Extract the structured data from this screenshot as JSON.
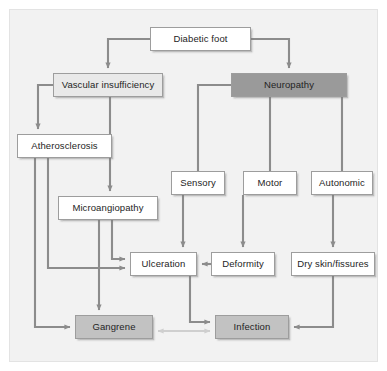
{
  "figure": {
    "width": 387,
    "height": 371,
    "background": "#f2f2f2",
    "page_background": "#ffffff",
    "border_color": "#e3e3e3"
  },
  "palette": {
    "white_box": "#ffffff",
    "light_box": "#e9e9e9",
    "mid_box": "#c2c2c2",
    "dark_box": "#9a9a9a",
    "box_border": "#9d9d9d",
    "connector": "#8c8c8c",
    "connector_light": "#cfcfcf",
    "text": "#242424"
  },
  "nodes": [
    {
      "id": "diabetic-foot",
      "label": "Diabetic foot",
      "shade": "white",
      "x": 150,
      "y": 27,
      "w": 101,
      "h": 24
    },
    {
      "id": "vascular",
      "label": "Vascular insufficiency",
      "shade": "light",
      "x": 53,
      "y": 73,
      "w": 110,
      "h": 24
    },
    {
      "id": "neuropathy",
      "label": "Neuropathy",
      "shade": "dark",
      "x": 231,
      "y": 73,
      "w": 116,
      "h": 24
    },
    {
      "id": "atherosclerosis",
      "label": "Atherosclerosis",
      "shade": "white",
      "x": 17,
      "y": 134,
      "w": 95,
      "h": 24
    },
    {
      "id": "microangiopathy",
      "label": "Microangiopathy",
      "shade": "white",
      "x": 58,
      "y": 196,
      "w": 100,
      "h": 24
    },
    {
      "id": "sensory",
      "label": "Sensory",
      "shade": "white",
      "x": 171,
      "y": 171,
      "w": 54,
      "h": 24
    },
    {
      "id": "motor",
      "label": "Motor",
      "shade": "white",
      "x": 243,
      "y": 171,
      "w": 54,
      "h": 24
    },
    {
      "id": "autonomic",
      "label": "Autonomic",
      "shade": "white",
      "x": 311,
      "y": 171,
      "w": 62,
      "h": 24
    },
    {
      "id": "ulceration",
      "label": "Ulceration",
      "shade": "white",
      "x": 130,
      "y": 252,
      "w": 67,
      "h": 24
    },
    {
      "id": "deformity",
      "label": "Deformity",
      "shade": "white",
      "x": 211,
      "y": 252,
      "w": 64,
      "h": 24
    },
    {
      "id": "dry-skin",
      "label": "Dry skin/fissures",
      "shade": "white",
      "x": 291,
      "y": 252,
      "w": 84,
      "h": 24
    },
    {
      "id": "gangrene",
      "label": "Gangrene",
      "shade": "mid",
      "x": 75,
      "y": 315,
      "w": 78,
      "h": 24
    },
    {
      "id": "infection",
      "label": "Infection",
      "shade": "mid",
      "x": 215,
      "y": 315,
      "w": 74,
      "h": 24
    }
  ],
  "edges": [
    {
      "id": "e-df-vascular",
      "from": "diabetic-foot",
      "to": "vascular",
      "style": "solid",
      "arrow": "single"
    },
    {
      "id": "e-df-neuropathy",
      "from": "diabetic-foot",
      "to": "neuropathy",
      "style": "solid",
      "arrow": "single"
    },
    {
      "id": "e-vasc-athero",
      "from": "vascular",
      "to": "atherosclerosis",
      "style": "solid",
      "arrow": "single"
    },
    {
      "id": "e-vasc-micro",
      "from": "vascular",
      "to": "microangiopathy",
      "style": "solid",
      "arrow": "single"
    },
    {
      "id": "e-athero-ulcer",
      "from": "atherosclerosis",
      "to": "ulceration",
      "style": "solid",
      "arrow": "single"
    },
    {
      "id": "e-athero-gangrene",
      "from": "atherosclerosis",
      "to": "gangrene",
      "style": "solid",
      "arrow": "single"
    },
    {
      "id": "e-micro-ulcer",
      "from": "microangiopathy",
      "to": "ulceration",
      "style": "solid",
      "arrow": "single"
    },
    {
      "id": "e-micro-gangrene",
      "from": "microangiopathy",
      "to": "gangrene",
      "style": "solid",
      "arrow": "single"
    },
    {
      "id": "e-neuro-sensory",
      "from": "neuropathy",
      "to": "sensory",
      "style": "solid",
      "arrow": "none"
    },
    {
      "id": "e-neuro-motor",
      "from": "neuropathy",
      "to": "motor",
      "style": "solid",
      "arrow": "none"
    },
    {
      "id": "e-neuro-autonomic",
      "from": "neuropathy",
      "to": "autonomic",
      "style": "solid",
      "arrow": "none"
    },
    {
      "id": "e-sensory-ulcer",
      "from": "sensory",
      "to": "ulceration",
      "style": "solid",
      "arrow": "single"
    },
    {
      "id": "e-motor-deformity",
      "from": "motor",
      "to": "deformity",
      "style": "solid",
      "arrow": "single"
    },
    {
      "id": "e-auto-dryskin",
      "from": "autonomic",
      "to": "dry-skin",
      "style": "solid",
      "arrow": "single"
    },
    {
      "id": "e-deformity-ulcer",
      "from": "deformity",
      "to": "ulceration",
      "style": "solid",
      "arrow": "single"
    },
    {
      "id": "e-ulcer-infection",
      "from": "ulceration",
      "to": "infection",
      "style": "solid",
      "arrow": "single"
    },
    {
      "id": "e-dryskin-infection",
      "from": "dry-skin",
      "to": "infection",
      "style": "solid",
      "arrow": "single"
    },
    {
      "id": "e-gangrene-infection",
      "from": "gangrene",
      "to": "infection",
      "style": "light",
      "arrow": "double"
    }
  ]
}
